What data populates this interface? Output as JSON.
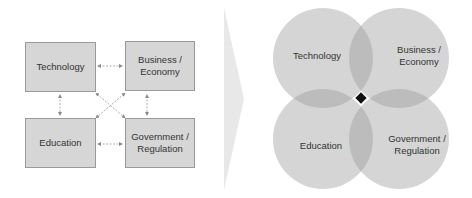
{
  "left_diagram": {
    "title": "Separate domains",
    "boxes": [
      {
        "label_line1": "Technology",
        "label_line2": ""
      },
      {
        "label_line1": "Business /",
        "label_line2": "Economy"
      },
      {
        "label_line1": "Education",
        "label_line2": ""
      },
      {
        "label_line1": "Government /",
        "label_line2": "Regulation"
      }
    ],
    "connectors": "bidirectional-dashed-arrows"
  },
  "transition": {
    "icon": "chevron-right-icon"
  },
  "right_diagram": {
    "title": "Overlapping domains",
    "circles": [
      {
        "label_line1": "Technology",
        "label_line2": ""
      },
      {
        "label_line1": "Business /",
        "label_line2": "Economy"
      },
      {
        "label_line1": "Education",
        "label_line2": ""
      },
      {
        "label_line1": "Government /",
        "label_line2": "Regulation"
      }
    ],
    "center_marker": "diamond"
  },
  "colors": {
    "box_fill": "#d6d6d6",
    "box_border": "#9a9a9a",
    "circle_fill": "#bdbdbd",
    "center_marker": "#111111",
    "chevron": "#e6e6e6"
  }
}
